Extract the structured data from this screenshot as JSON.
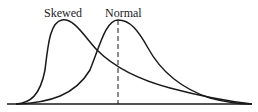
{
  "diagram": {
    "title": "",
    "labels": {
      "skewed": "Skewed",
      "normal": "Normal"
    },
    "curves": [
      {
        "name": "Skewed",
        "peak_x": 62,
        "description": "right-skewed distribution, sharp rise, long right tail"
      },
      {
        "name": "Normal",
        "peak_x": 118,
        "description": "symmetric-looking curve with dashed vertical line at peak (mean)"
      }
    ],
    "colors": {
      "line": "#1a1a1a",
      "background": "#ffffff"
    }
  }
}
